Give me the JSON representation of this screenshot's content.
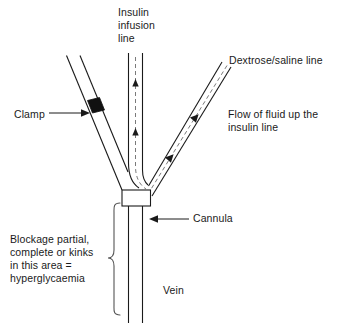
{
  "diagram": {
    "type": "medical-line-diagram",
    "background_color": "#ffffff",
    "line_color": "#1a1a1a",
    "clamp_color": "#111111",
    "labels": {
      "insulin_line": "Insulin\ninfusion\nline",
      "dextrose_line": "Dextrose/saline line",
      "flow_note": "Flow of fluid up the\ninsulin line",
      "clamp": "Clamp",
      "cannula": "Cannula",
      "blockage_note": "Blockage partial,\ncomplete or kinks\nin this area =\nhyperglycaemia",
      "vein": "Vein"
    },
    "parts": {
      "clamp": "clamp-marker",
      "hub": "cannula-hub",
      "brace": "blockage-area-brace",
      "insulin_flow_arrows": 2,
      "dextrose_flow_arrows": 2
    }
  }
}
